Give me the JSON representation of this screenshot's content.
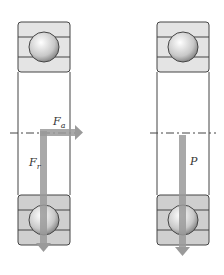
{
  "diagram": {
    "type": "bearing-load-diagram",
    "left_bearing": {
      "labels": {
        "axial_force": "F",
        "axial_sub": "a",
        "radial_force": "F",
        "radial_sub": "r"
      }
    },
    "right_bearing": {
      "labels": {
        "equivalent_load": "P"
      }
    },
    "colors": {
      "ring_fill": "#d0d0d0",
      "outline": "#444444",
      "arrow": "#9a9a9a",
      "ball": "#e6e6e6"
    }
  }
}
